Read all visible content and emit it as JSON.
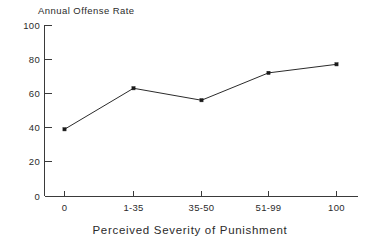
{
  "chart_data": {
    "type": "line",
    "title": "Annual Offense Rate",
    "subtitle": "",
    "xlabel": "Perceived Severity of Punishment",
    "ylabel": "Annual Offense Rate",
    "categories": [
      "0",
      "1-35",
      "35-50",
      "51-99",
      "100"
    ],
    "values": [
      39,
      63,
      56,
      72,
      77
    ],
    "series": [
      {
        "name": "Annual Offense Rate",
        "values": [
          39,
          63,
          56,
          72,
          77
        ]
      }
    ],
    "ylim": [
      0,
      100
    ],
    "yticks": [
      "0",
      "20",
      "40",
      "60",
      "80",
      "100"
    ],
    "ytick_values": [
      0,
      20,
      40,
      60,
      80,
      100
    ],
    "xticks": [
      "0",
      "1-35",
      "35-50",
      "51-99",
      "100"
    ],
    "grid": false,
    "legend": false,
    "legend_position": "none",
    "markers": "filled-square",
    "line_color": "#2b2b2b",
    "marker_color": "#1a1a1a",
    "axis_color": "#3a3a3a",
    "background": "#ffffff"
  },
  "axis": {
    "y_tick_0": "0",
    "y_tick_1": "20",
    "y_tick_2": "40",
    "y_tick_3": "60",
    "y_tick_4": "80",
    "y_tick_5": "100",
    "x_tick_0": "0",
    "x_tick_1": "1-35",
    "x_tick_2": "35-50",
    "x_tick_3": "51-99",
    "x_tick_4": "100"
  }
}
